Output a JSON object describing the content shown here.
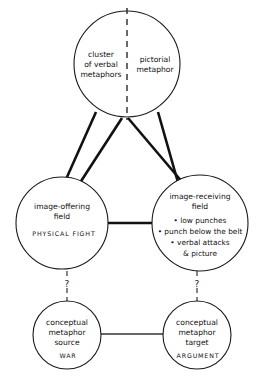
{
  "diagram": {
    "type": "node-link-concept-diagram",
    "title": "",
    "background_color": "#ffffff",
    "line_color": "#111111"
  },
  "nodes": {
    "top": {
      "name": "cluster-node",
      "left_half": {
        "lines": [
          "cluster",
          "of verbal",
          "metaphors"
        ]
      },
      "right_half": {
        "lines": [
          "pictorial",
          "metaphor"
        ]
      },
      "divider": "dashed-vertical"
    },
    "image_offering": {
      "name": "image-offering-field",
      "lines": [
        "image-offering",
        "field"
      ],
      "caps_label": "PHYSICAL FIGHT"
    },
    "image_receiving": {
      "name": "image-receiving-field",
      "lines": [
        "image-receiving",
        "field"
      ],
      "bullets": [
        "• low punches",
        "• punch below the belt",
        "• verbal attacks",
        "& picture"
      ]
    },
    "conceptual_source": {
      "name": "conceptual-metaphor-source",
      "lines": [
        "conceptual",
        "metaphor",
        "source"
      ],
      "caps_label": "WAR"
    },
    "conceptual_target": {
      "name": "conceptual-metaphor-target",
      "lines": [
        "conceptual",
        "metaphor",
        "target"
      ],
      "caps_label": "ARGUMENT"
    }
  },
  "connectors": {
    "mapping_lines_count": 4,
    "mapping_style": "solid-thick-crossing",
    "middle_link": {
      "style": "solid-thick-horizontal"
    },
    "bottom_link": {
      "style": "solid-thin-horizontal"
    },
    "left_vertical": {
      "style": "dashed-vertical",
      "label": "?"
    },
    "right_vertical": {
      "style": "dashed-vertical",
      "label": "?"
    }
  }
}
